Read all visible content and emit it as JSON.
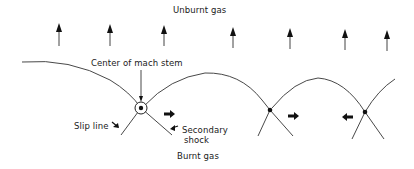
{
  "diagram": {
    "labels": {
      "unburnt_gas": "Unburnt gas",
      "center_of_mach_stem": "Center of mach stem",
      "slip_line": "Slip line",
      "secondary_shock_line1": "Secondary",
      "secondary_shock_line2": "shock",
      "burnt_gas": "Burnt gas"
    },
    "flow_arrows_x": [
      59,
      110,
      164,
      233,
      290,
      345,
      387
    ],
    "triple_points": [
      {
        "x": 141,
        "y": 108,
        "type": "mach-stem-center"
      },
      {
        "x": 270,
        "y": 110,
        "type": "triple-point"
      },
      {
        "x": 365,
        "y": 112,
        "type": "triple-point"
      }
    ],
    "transverse_arrows": [
      {
        "x": 169,
        "y": 115,
        "direction": "right"
      },
      {
        "x": 295,
        "y": 117,
        "direction": "right"
      },
      {
        "x": 347,
        "y": 118,
        "direction": "left"
      }
    ],
    "colors": {
      "line": "#333333",
      "text": "#1a1a1a",
      "background": "#ffffff"
    }
  }
}
